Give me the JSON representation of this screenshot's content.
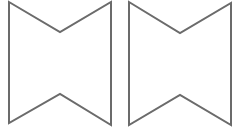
{
  "diagram": {
    "background": "#ffffff",
    "stroke_color": "#6b6b6b",
    "shapes": [
      {
        "name": "left-notched-shape",
        "points": "9,2 60,32 111,2 111,125 60,94 9,123"
      },
      {
        "name": "right-notched-shape",
        "points": "129,2 180,33 231,3 231,125 180,95 129,125"
      }
    ]
  }
}
